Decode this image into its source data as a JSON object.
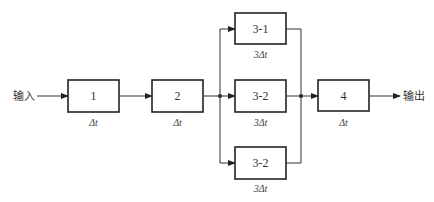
{
  "diagram": {
    "type": "pipeline-block-diagram",
    "input_label": "输入",
    "output_label": "输出",
    "stages": [
      {
        "id": "1",
        "label": "1",
        "time": "Δt"
      },
      {
        "id": "2",
        "label": "2",
        "time": "Δt"
      },
      {
        "id": "3a",
        "label": "3-1",
        "time": "3Δt"
      },
      {
        "id": "3b",
        "label": "3-2",
        "time": "3Δt"
      },
      {
        "id": "3c",
        "label": "3-2",
        "time": "3Δt"
      },
      {
        "id": "4",
        "label": "4",
        "time": "Δt"
      }
    ],
    "edges": [
      [
        "input",
        "1"
      ],
      [
        "1",
        "2"
      ],
      [
        "2",
        "3a"
      ],
      [
        "2",
        "3b"
      ],
      [
        "2",
        "3c"
      ],
      [
        "3a",
        "4"
      ],
      [
        "3b",
        "4"
      ],
      [
        "3c",
        "4"
      ],
      [
        "4",
        "output"
      ]
    ],
    "colors": {
      "line": "#333333",
      "box_border": "#222222",
      "background": "#ffffff"
    }
  }
}
